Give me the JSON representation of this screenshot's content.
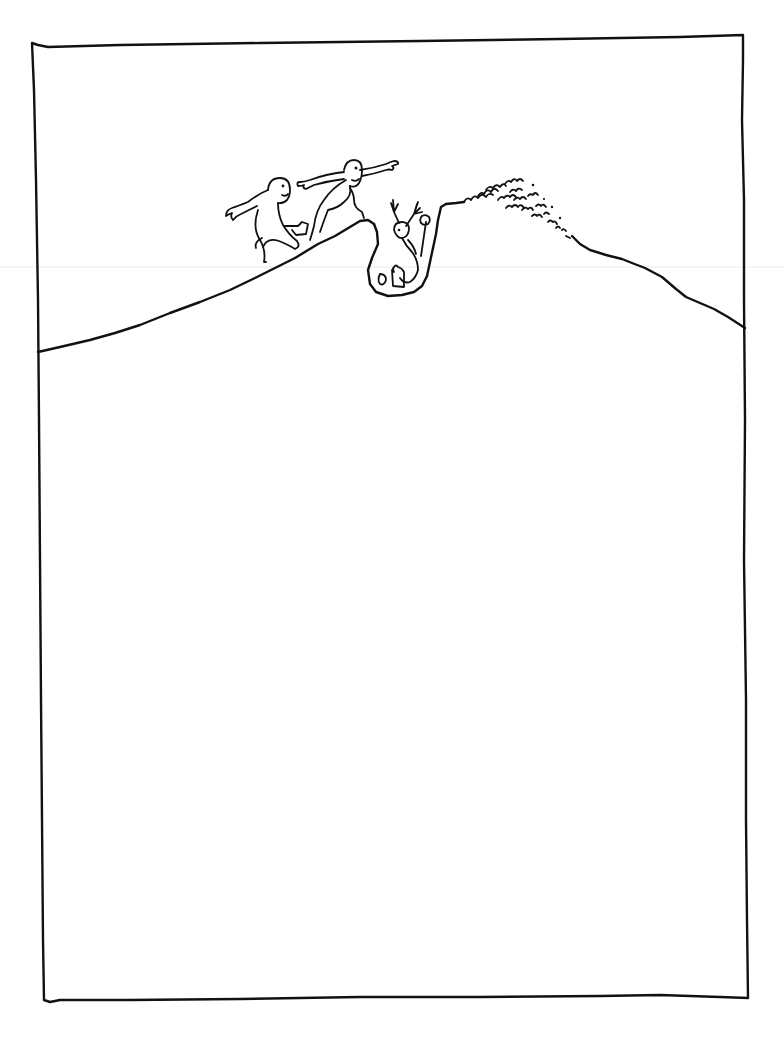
{
  "illustration": {
    "kind": "pen-and-ink cartoon",
    "caption": "",
    "ink_color": "#111111",
    "paper_color": "#ffffff",
    "elements": {
      "frame": "hand-drawn rectangular border",
      "hill": "long sloping hill line crossing the upper third of the frame",
      "pit": "narrow hole dug into the hilltop",
      "dirt_pile": "heap of loose dirt on the right side of the pit",
      "figures": [
        {
          "id": "figure-left",
          "pose": "crouching, walking up the slope carrying a shovel"
        },
        {
          "id": "figure-leaping",
          "pose": "leaping forward with arms outstretched over the crest"
        },
        {
          "id": "figure-in-pit",
          "pose": "falling backward into the pit, arms raised"
        }
      ],
      "props": [
        "shovel",
        "bucket",
        "shovel-in-pit"
      ]
    }
  }
}
